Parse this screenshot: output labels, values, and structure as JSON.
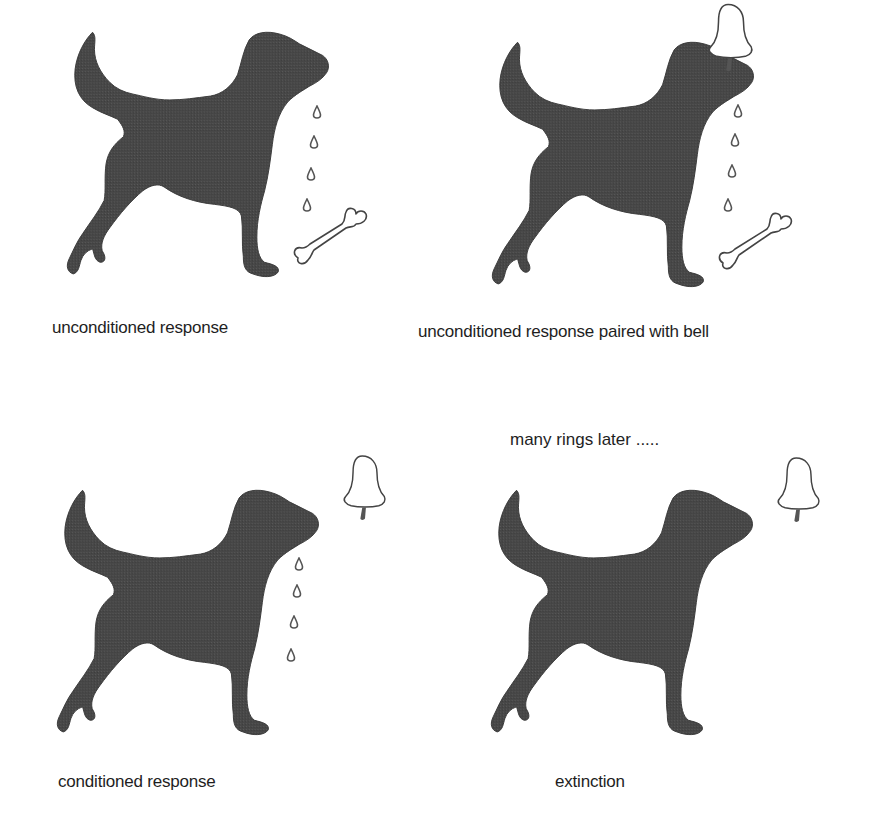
{
  "diagram": {
    "topic": "classical conditioning",
    "colors": {
      "dog": "#4a4a4a",
      "outline": "#3a3a3a",
      "background": "#ffffff",
      "text": "#1e1e1e"
    },
    "panels": [
      {
        "caption": "unconditioned response",
        "elements": [
          "dog-silhouette",
          "saliva-drops",
          "bone"
        ],
        "drops": 4,
        "bell": false,
        "bone": true
      },
      {
        "caption": "unconditioned response paired with bell",
        "elements": [
          "dog-silhouette",
          "saliva-drops",
          "bone",
          "bell"
        ],
        "drops": 4,
        "bell": true,
        "bone": true
      },
      {
        "caption": "conditioned response",
        "elements": [
          "dog-silhouette",
          "saliva-drops",
          "bell"
        ],
        "drops": 4,
        "bell": true,
        "bone": false
      },
      {
        "caption": "extinction",
        "elements": [
          "dog-silhouette",
          "bell"
        ],
        "drops": 0,
        "bell": true,
        "bone": false
      }
    ],
    "transition_note": "many rings later ....."
  }
}
